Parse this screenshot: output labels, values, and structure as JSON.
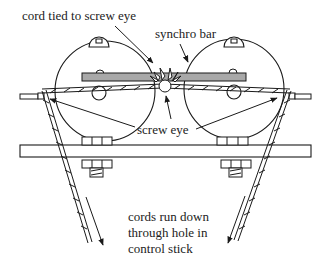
{
  "diagram": {
    "labels": {
      "cord_tied": "cord tied to screw eye",
      "synchro_bar": "synchro bar",
      "screw_eye": "screw eye",
      "cords_line1": "cords run down",
      "cords_line2": "through hole in",
      "cords_line3": "control stick"
    },
    "colors": {
      "stroke": "#1a1a1a",
      "bar_fill": "#a8a8a8",
      "background": "#ffffff"
    }
  }
}
